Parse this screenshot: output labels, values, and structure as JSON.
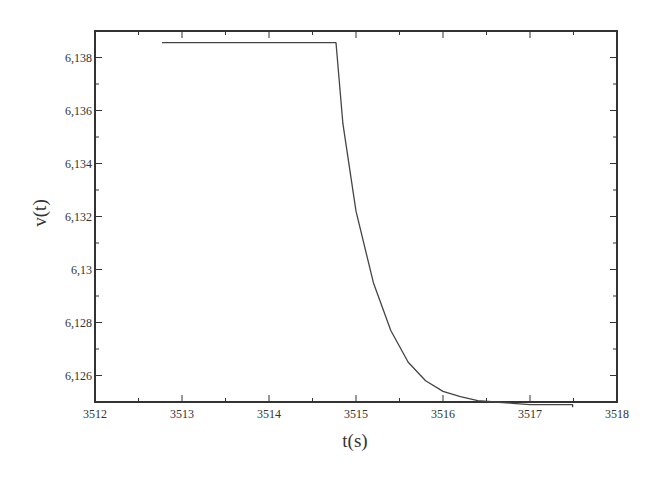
{
  "chart_data": {
    "type": "line",
    "title": "",
    "xlabel": "t(s)",
    "ylabel": "v(t)",
    "xlim": [
      3512,
      3518
    ],
    "ylim": [
      6.125,
      6.139
    ],
    "grid": false,
    "legend": null,
    "x_ticks": [
      "3512",
      "3513",
      "3514",
      "3515",
      "3516",
      "3517",
      "3518"
    ],
    "x_tick_values": [
      3512,
      3513,
      3514,
      3515,
      3516,
      3517,
      3518
    ],
    "y_ticks": [
      "6,126",
      "6,128",
      "6,13",
      "6,132",
      "6,134",
      "6,136",
      "6,138"
    ],
    "y_tick_values": [
      6.126,
      6.128,
      6.13,
      6.132,
      6.134,
      6.136,
      6.138
    ],
    "series": [
      {
        "name": "v(t)",
        "color": "#444444",
        "x": [
          3512.77,
          3514.77,
          3514.85,
          3515.0,
          3515.2,
          3515.4,
          3515.6,
          3515.8,
          3516.0,
          3516.2,
          3516.4,
          3516.6,
          3516.8,
          3517.0,
          3517.2,
          3517.49,
          3517.49
        ],
        "y": [
          6.13856,
          6.13856,
          6.1355,
          6.1322,
          6.1295,
          6.1277,
          6.1265,
          6.1258,
          6.1254,
          6.1252,
          6.12505,
          6.125,
          6.12495,
          6.1249,
          6.1249,
          6.1249,
          6.1248
        ]
      }
    ]
  }
}
